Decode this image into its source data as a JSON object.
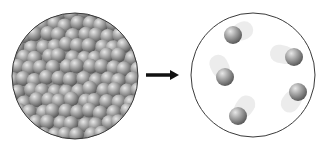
{
  "diagram": {
    "left_panel": {
      "label": "",
      "state": "densely-packed",
      "circle": {
        "cx": 75,
        "cy": 76,
        "r": 63
      },
      "fill": "#9a9a9a"
    },
    "arrow": {
      "x1": 146,
      "x2": 178,
      "y": 75,
      "color": "#111111"
    },
    "right_panel": {
      "label": "",
      "state": "sparse-moving",
      "circle": {
        "cx": 253,
        "cy": 75,
        "r": 62
      },
      "particles": [
        {
          "cx": 233,
          "cy": 35,
          "trail_dx": 14,
          "trail_dy": -6
        },
        {
          "cx": 294,
          "cy": 57,
          "trail_dx": -18,
          "trail_dy": -4
        },
        {
          "cx": 225,
          "cy": 77,
          "trail_dx": -8,
          "trail_dy": -16
        },
        {
          "cx": 298,
          "cy": 92,
          "trail_dx": -10,
          "trail_dy": 14
        },
        {
          "cx": 238,
          "cy": 116,
          "trail_dx": 10,
          "trail_dy": -14
        }
      ],
      "particle_radius": 9
    }
  }
}
